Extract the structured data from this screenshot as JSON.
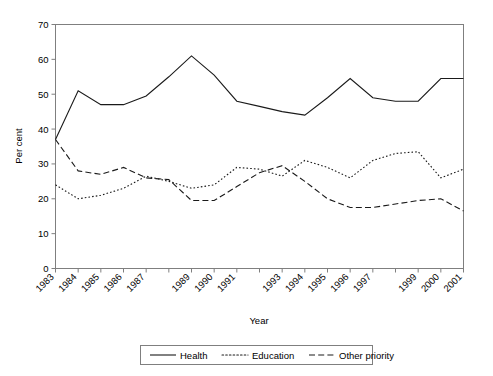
{
  "chart_data": {
    "type": "line",
    "title": "",
    "xlabel": "Year",
    "ylabel": "Per cent",
    "ylim": [
      0,
      70
    ],
    "ytick_step": 10,
    "yticks": [
      "0",
      "10",
      "20",
      "30",
      "40",
      "50",
      "60",
      "70"
    ],
    "grid": false,
    "legend_position": "bottom-center",
    "x": [
      1983,
      1984,
      1985,
      1986,
      1987,
      1988,
      1989,
      1990,
      1991,
      1992,
      1993,
      1994,
      1995,
      1996,
      1997,
      1998,
      1999,
      2000,
      2001
    ],
    "categories": [
      "1983",
      "1984",
      "1985",
      "1986",
      "1987",
      "",
      "1989",
      "1990",
      "1991",
      "",
      "1993",
      "1994",
      "1995",
      "1996",
      "1997",
      "",
      "1999",
      "2000",
      "2001"
    ],
    "tick_labels_shown": [
      "1983",
      "1984",
      "1985",
      "1986",
      "1987",
      "1989",
      "1990",
      "1991",
      "1993",
      "1994",
      "1995",
      "1996",
      "1997",
      "1999",
      "2000",
      "2001"
    ],
    "series": [
      {
        "name": "Health",
        "style": "solid",
        "color": "#1a1a1a",
        "values": [
          37,
          51,
          47,
          47,
          49.5,
          55,
          61,
          55.5,
          48,
          46.5,
          45,
          44,
          49,
          54.5,
          49,
          48,
          48,
          54.5,
          54.5
        ]
      },
      {
        "name": "Education",
        "style": "dotted",
        "color": "#1a1a1a",
        "values": [
          24,
          20,
          21,
          23,
          26.5,
          25,
          23,
          24,
          29,
          28.5,
          26.5,
          31,
          29,
          26,
          31,
          33,
          33.5,
          26,
          28.5
        ]
      },
      {
        "name": "Other priority",
        "style": "dashed",
        "color": "#1a1a1a",
        "values": [
          37,
          28,
          27,
          29,
          26,
          25.5,
          19.5,
          19.5,
          23.5,
          27.5,
          29.5,
          25,
          20,
          17.5,
          17.5,
          18.5,
          19.5,
          20,
          16.5
        ]
      }
    ]
  },
  "legend": {
    "items": [
      {
        "label": "Health",
        "style": "solid"
      },
      {
        "label": "Education",
        "style": "dotted"
      },
      {
        "label": "Other priority",
        "style": "dashed"
      }
    ]
  },
  "axes": {
    "x_title": "Year",
    "y_title": "Per cent"
  }
}
